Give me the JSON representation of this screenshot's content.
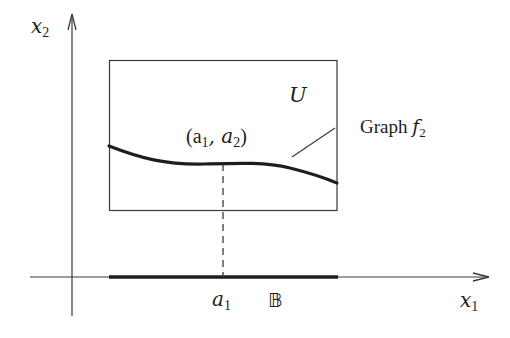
{
  "figure": {
    "axes": {
      "x_label": "x",
      "x_label_sub": "1",
      "y_label": "x",
      "y_label_sub": "2"
    },
    "region": {
      "label": "U"
    },
    "point": {
      "label_open": "(a",
      "label_sub1": "1",
      "label_mid": ", a",
      "label_sub2": "2",
      "label_close": ")"
    },
    "graph": {
      "label": "Graph ",
      "label_func": "f",
      "label_func_sub": "2"
    },
    "base": {
      "tick_label": "a",
      "tick_label_sub": "1",
      "set_label": "𝔹"
    },
    "colors": {
      "ink": "#1e1e1e",
      "thin_line": "#3a3a3a",
      "background": "#ffffff"
    }
  }
}
